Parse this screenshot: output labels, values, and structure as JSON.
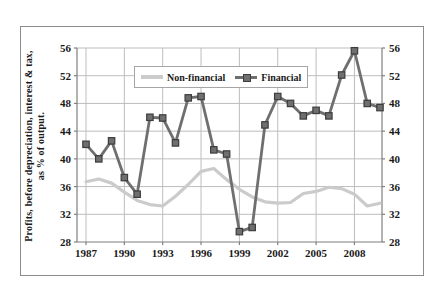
{
  "figure": {
    "y_axis_title_line1": "Profits, before depreciation, interest & tax,",
    "y_axis_title_line2": "as % of output."
  },
  "colors": {
    "background": "#ffffff",
    "frame_border": "#8c8c8c",
    "gridline": "#bdbdbd",
    "axis": "#7f7f7f",
    "text": "#1a1a1a",
    "nonfinancial_line": "#cbcbcb",
    "financial_line": "#6f6f6f",
    "financial_marker_edge": "#3c3c3c"
  },
  "chart_data": {
    "type": "line",
    "title": "",
    "xlabel": "",
    "ylabel": "Profits, before depreciation, interest & tax, as % of output.",
    "x": [
      1987,
      1988,
      1989,
      1990,
      1991,
      1992,
      1993,
      1994,
      1995,
      1996,
      1997,
      1998,
      1999,
      2000,
      2001,
      2002,
      2003,
      2004,
      2005,
      2006,
      2007,
      2008,
      2009,
      2010
    ],
    "x_tick_labels": [
      "1987",
      "1990",
      "1993",
      "1996",
      "1999",
      "2002",
      "2005",
      "2008"
    ],
    "ylim": [
      28,
      56
    ],
    "y_ticks": [
      28,
      32,
      36,
      40,
      44,
      48,
      52,
      56
    ],
    "y_axis_sides": [
      "left",
      "right"
    ],
    "grid": true,
    "legend_position": "top-center",
    "series": [
      {
        "name": "Non-financial",
        "color": "#cbcbcb",
        "line_width": 3.2,
        "marker": "none",
        "values": [
          36.7,
          37.1,
          36.5,
          35.2,
          34.0,
          33.4,
          33.2,
          34.6,
          36.3,
          38.2,
          38.6,
          37.0,
          35.6,
          34.5,
          33.8,
          33.6,
          33.7,
          35.0,
          35.3,
          35.9,
          35.7,
          34.9,
          33.2,
          33.6
        ]
      },
      {
        "name": "Financial",
        "color": "#6f6f6f",
        "line_width": 2.8,
        "marker": "square",
        "marker_size": 6.4,
        "marker_color": "#6f6f6f",
        "marker_edge": "#3c3c3c",
        "values": [
          42.1,
          40.0,
          42.6,
          37.3,
          34.9,
          46.0,
          45.9,
          42.3,
          48.8,
          49.0,
          41.3,
          40.7,
          29.5,
          30.1,
          44.9,
          49.0,
          48.0,
          46.2,
          47.0,
          46.2,
          52.1,
          55.6,
          48.0,
          47.4
        ]
      }
    ]
  }
}
